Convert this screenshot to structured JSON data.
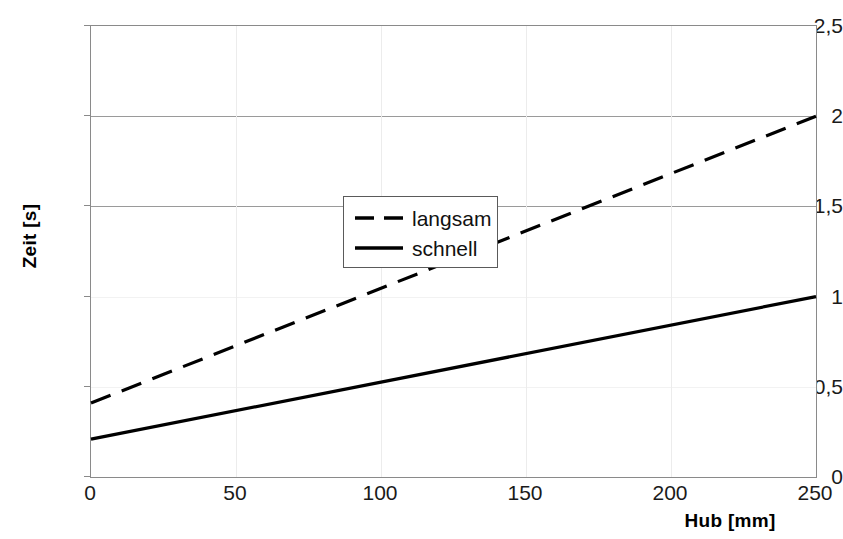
{
  "chart_data": {
    "type": "line",
    "title": "",
    "xlabel": "Hub [mm]",
    "ylabel": "Zeit [s]",
    "xlim": [
      0,
      250
    ],
    "ylim": [
      0,
      2.5
    ],
    "grid": true,
    "legend_position": "center-left-inside",
    "x_ticks": [
      {
        "value": 0,
        "label": "0"
      },
      {
        "value": 50,
        "label": "50"
      },
      {
        "value": 100,
        "label": "100"
      },
      {
        "value": 150,
        "label": "150"
      },
      {
        "value": 200,
        "label": "200"
      },
      {
        "value": 250,
        "label": "250"
      }
    ],
    "y_ticks": [
      {
        "value": 0,
        "label": "0"
      },
      {
        "value": 0.5,
        "label": "0,5"
      },
      {
        "value": 1,
        "label": "1"
      },
      {
        "value": 1.5,
        "label": "1,5"
      },
      {
        "value": 2,
        "label": "2"
      },
      {
        "value": 2.5,
        "label": "2,5"
      }
    ],
    "x": [
      0,
      250
    ],
    "series": [
      {
        "name": "langsam",
        "style": "dashed",
        "color": "#000000",
        "values": [
          0.41,
          2.0
        ]
      },
      {
        "name": "schnell",
        "style": "solid",
        "color": "#000000",
        "values": [
          0.21,
          1.0
        ]
      }
    ]
  },
  "legend": {
    "entries": [
      {
        "label": "langsam",
        "style": "dashed"
      },
      {
        "label": "schnell",
        "style": "solid"
      }
    ]
  },
  "colors": {
    "axis": "#8a8a8a",
    "gridline_major": "#9a9a9a",
    "gridline_minor": "#ececec",
    "series": "#000000",
    "text": "#111111"
  }
}
